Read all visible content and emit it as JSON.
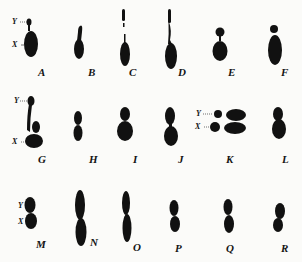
{
  "figure": {
    "ink_color": "#111111",
    "background": "#fbfbf9",
    "panels": [
      {
        "label": "A",
        "x_label": "X",
        "y_label": "Y"
      },
      {
        "label": "B"
      },
      {
        "label": "C"
      },
      {
        "label": "D"
      },
      {
        "label": "E"
      },
      {
        "label": "F"
      },
      {
        "label": "G",
        "x_label": "X",
        "y_label": "Y"
      },
      {
        "label": "H"
      },
      {
        "label": "I"
      },
      {
        "label": "J"
      },
      {
        "label": "K",
        "x_label": "X",
        "y_label": "Y"
      },
      {
        "label": "L"
      },
      {
        "label": "M",
        "x_label": "X",
        "y_label": "Y"
      },
      {
        "label": "N"
      },
      {
        "label": "O"
      },
      {
        "label": "P"
      },
      {
        "label": "Q"
      },
      {
        "label": "R"
      }
    ]
  }
}
